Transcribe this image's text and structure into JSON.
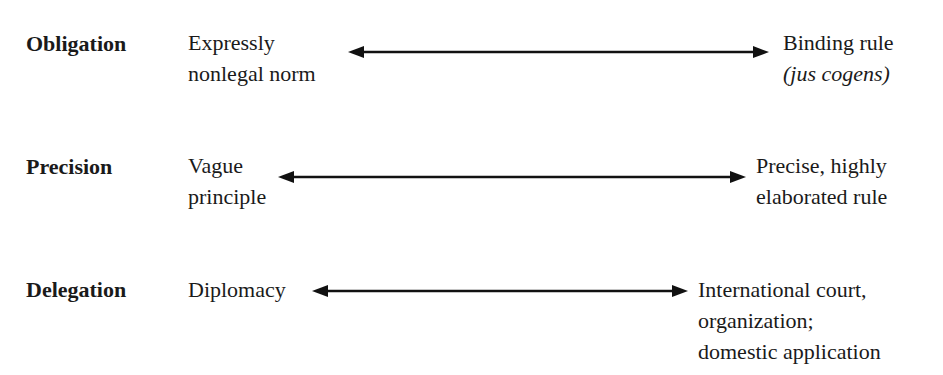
{
  "diagram": {
    "type": "continuum",
    "rows": [
      {
        "dimension": "Obligation",
        "low": {
          "lines": [
            "Expressly",
            "nonlegal norm"
          ]
        },
        "high": {
          "lines": [
            "Binding rule",
            "(jus cogens)"
          ],
          "italic_line_index": 1
        }
      },
      {
        "dimension": "Precision",
        "low": {
          "lines": [
            "Vague",
            "principle"
          ]
        },
        "high": {
          "lines": [
            "Precise, highly",
            "elaborated rule"
          ]
        }
      },
      {
        "dimension": "Delegation",
        "low": {
          "lines": [
            "Diplomacy"
          ]
        },
        "high": {
          "lines": [
            "International court,",
            "organization;",
            "domestic application"
          ]
        }
      }
    ],
    "arrow_color": "#111111",
    "text_color": "#1a1a1a"
  }
}
